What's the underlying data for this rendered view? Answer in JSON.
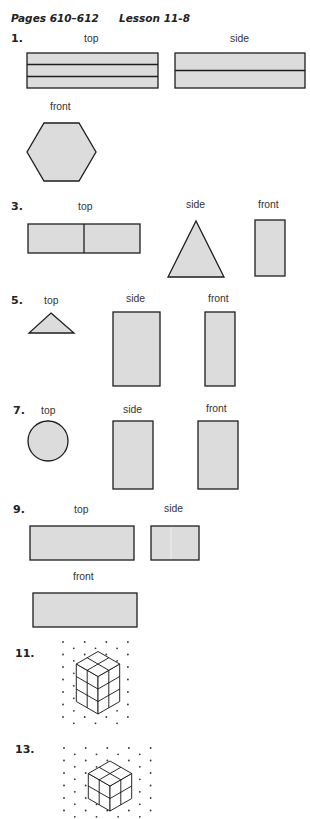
{
  "header": {
    "pages": "Pages 610–612",
    "lesson": "Lesson 11-8"
  },
  "colors": {
    "shape_fill": "#dcdcdc",
    "outline": "#1e1e1e"
  },
  "problems": [
    {
      "number": "1.",
      "views": [
        {
          "label": "top",
          "shape": "rectangle",
          "divisions": 3,
          "orientation": "horizontal"
        },
        {
          "label": "side",
          "shape": "rectangle",
          "divisions": 2,
          "orientation": "horizontal"
        },
        {
          "label": "front",
          "shape": "hexagon"
        }
      ]
    },
    {
      "number": "3.",
      "views": [
        {
          "label": "top",
          "shape": "rectangle",
          "divisions": 2,
          "orientation": "vertical"
        },
        {
          "label": "side",
          "shape": "triangle"
        },
        {
          "label": "front",
          "shape": "rectangle"
        }
      ]
    },
    {
      "number": "5.",
      "views": [
        {
          "label": "top",
          "shape": "triangle"
        },
        {
          "label": "side",
          "shape": "rectangle"
        },
        {
          "label": "front",
          "shape": "rectangle"
        }
      ]
    },
    {
      "number": "7.",
      "views": [
        {
          "label": "top",
          "shape": "circle"
        },
        {
          "label": "side",
          "shape": "rectangle"
        },
        {
          "label": "front",
          "shape": "rectangle"
        }
      ]
    },
    {
      "number": "9.",
      "views": [
        {
          "label": "top",
          "shape": "rectangle"
        },
        {
          "label": "side",
          "shape": "rectangle"
        },
        {
          "label": "front",
          "shape": "rectangle"
        }
      ]
    },
    {
      "number": "11.",
      "drawing": "isometric",
      "cubes": {
        "width": 2,
        "depth": 2,
        "height": 3
      }
    },
    {
      "number": "13.",
      "drawing": "isometric",
      "cubes": {
        "width": 2,
        "depth": 2,
        "height": 2
      }
    }
  ]
}
